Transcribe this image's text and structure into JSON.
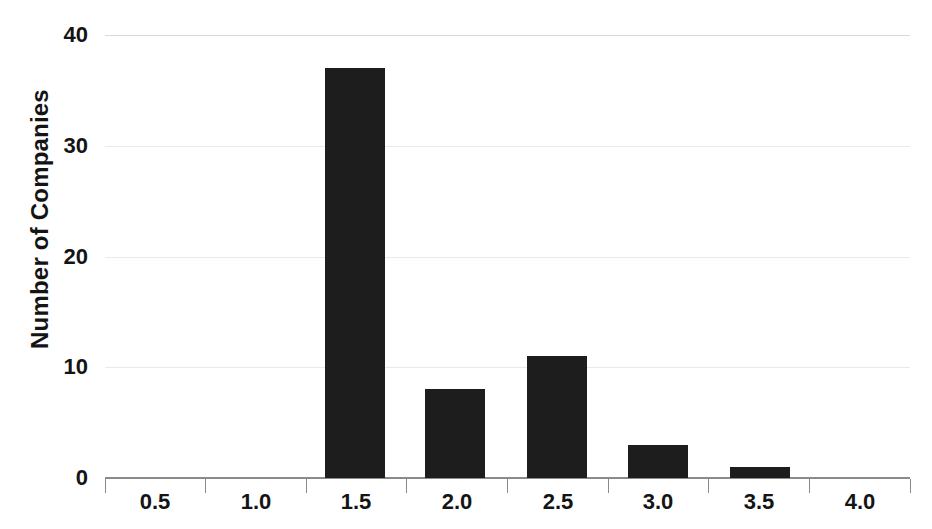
{
  "chart_data": {
    "type": "bar",
    "title": "",
    "xlabel": "",
    "ylabel": "Number of Companies",
    "categories": [
      "0.5",
      "1.0",
      "1.5",
      "2.0",
      "2.5",
      "3.0",
      "3.5",
      "4.0"
    ],
    "values": [
      0,
      0,
      37,
      8,
      11,
      3,
      1,
      0
    ],
    "x_tick_labels": [
      "0.5",
      "1.0",
      "1.5",
      "2.0",
      "2.5",
      "3.0",
      "3.5",
      "4.0"
    ],
    "y_tick_labels": [
      "40",
      "30",
      "20",
      "10",
      "0"
    ],
    "y_tick_values": [
      40,
      30,
      20,
      10,
      0
    ],
    "ylim": [
      0,
      40
    ],
    "grid": true,
    "grid_axis": "y",
    "legend": "none",
    "bar_color": "#1d1d1d",
    "gridline_color": "#e9e9e9",
    "axis_color": "#8a8a8a",
    "background_color": "#ffffff",
    "text_color": "#141414"
  }
}
